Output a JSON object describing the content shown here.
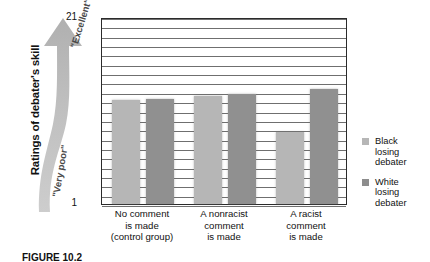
{
  "figure": {
    "caption": "FIGURE 10.2",
    "y_axis_title": "Ratings of debater's skill",
    "arrow_top_label": "\"Excellent\"",
    "arrow_bottom_label": "\"Very poor\""
  },
  "legend": {
    "items": [
      {
        "label_line1": "Black",
        "label_line2": "losing",
        "label_line3": "debater",
        "color": "#b6b6b6",
        "swatch_name": "legend-swatch-black-losing-debater"
      },
      {
        "label_line1": "White",
        "label_line2": "losing",
        "label_line3": "debater",
        "color": "#8d8d8d",
        "swatch_name": "legend-swatch-white-losing-debater"
      }
    ]
  },
  "chart_data": {
    "type": "bar",
    "title": "",
    "xlabel": "",
    "ylabel": "Ratings of debater's skill",
    "ylim": [
      1,
      21
    ],
    "yticks": [
      "1",
      "21"
    ],
    "ytick_top": "21",
    "ytick_bottom": "1",
    "grid": true,
    "gridline_count": 20,
    "legend_position": "right",
    "categories": [
      "No comment is made (control group)",
      "A nonracist comment is made",
      "A racist comment is made"
    ],
    "category_lines": [
      [
        "No comment",
        "is made",
        "(control group)"
      ],
      [
        "A nonracist",
        "comment",
        "is made"
      ],
      [
        "A racist",
        "comment",
        "is made"
      ]
    ],
    "series": [
      {
        "name": "Black losing debater",
        "color": "#b6b6b6",
        "values": [
          12.1,
          12.5,
          8.7
        ]
      },
      {
        "name": "White losing debater",
        "color": "#909090",
        "values": [
          12.2,
          12.8,
          13.3
        ]
      }
    ]
  }
}
